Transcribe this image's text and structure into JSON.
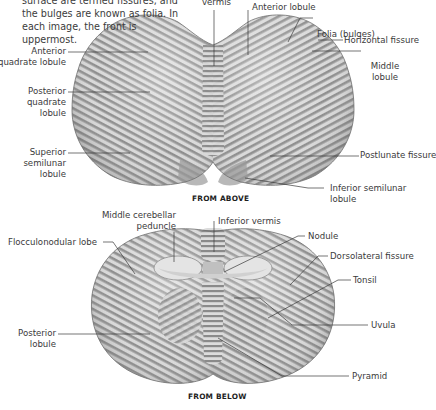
{
  "intro_text": "surface are termed fissures, and the bulges are known as folia. In each image, the front is uppermost.",
  "top_view": {
    "caption": "FROM ABOVE",
    "labels": {
      "vermis": "vermis",
      "anterior_lobule": "Anterior lobule",
      "folia": "Folia (bulges)",
      "horizontal_fissure": "Horizontal fissure",
      "middle_lobule_1": "Middle",
      "middle_lobule_2": "lobule",
      "postlunate_fissure": "Postlunate fissure",
      "inferior_semilunar_1": "Inferior semilunar",
      "inferior_semilunar_2": "lobule",
      "anterior_quadrate_1": "Anterior",
      "anterior_quadrate_2": "quadrate lobule",
      "posterior_quadrate_1": "Posterior",
      "posterior_quadrate_2": "quadrate",
      "posterior_quadrate_3": "lobule",
      "superior_semilunar_1": "Superior",
      "superior_semilunar_2": "semilunar",
      "superior_semilunar_3": "lobule"
    }
  },
  "bottom_view": {
    "caption": "FROM BELOW",
    "labels": {
      "middle_cerebellar_1": "Middle cerebellar",
      "middle_cerebellar_2": "peduncle",
      "inferior_vermis": "Inferior vermis",
      "flocculonodular": "Flocculonodular lobe",
      "nodule": "Nodule",
      "dorsolateral_fissure": "Dorsolateral fissure",
      "tonsil": "Tonsil",
      "uvula": "Uvula",
      "posterior_lobule_1": "Posterior",
      "posterior_lobule_2": "lobule",
      "pyramid": "Pyramid"
    }
  },
  "colors": {
    "background": "#ffffff",
    "tissue_light": "#f2f2f2",
    "tissue_mid": "#b8b8b8",
    "tissue_dark": "#7a7a7a",
    "leader_line": "#3a3a3a",
    "text": "#3a3a3a"
  }
}
